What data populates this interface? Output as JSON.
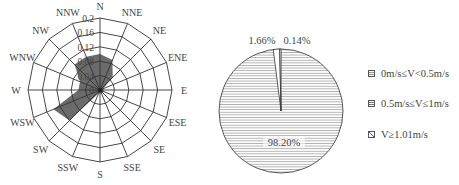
{
  "chart_data": [
    {
      "type": "radar",
      "subtype": "wind-rose",
      "title": "",
      "directions": [
        "N",
        "NNE",
        "NE",
        "ENE",
        "E",
        "ESE",
        "SE",
        "SSE",
        "S",
        "SSW",
        "SW",
        "WSW",
        "W",
        "WNW",
        "NW",
        "NNW"
      ],
      "values": [
        0.1,
        0.09,
        0.05,
        0.01,
        0.01,
        0.01,
        0.01,
        0.01,
        0.01,
        0.01,
        0.12,
        0.14,
        0.06,
        0.06,
        0.1,
        0.1
      ],
      "radial_ticks": [
        "0",
        "0.04",
        "0.08",
        "0.12",
        "0.16",
        "0.2"
      ],
      "radial_range": [
        0,
        0.2
      ],
      "grid": true,
      "fill_color": "#6b6b6b"
    },
    {
      "type": "pie",
      "title": "",
      "categories": [
        "0m/s≤V<0.5m/s",
        "0.5m/s≤V≤1m/s",
        "V≥1.01m/s"
      ],
      "values": [
        0.14,
        1.66,
        98.2
      ],
      "labels": [
        "0.14%",
        "1.66%",
        "98.20%"
      ],
      "legend_position": "right",
      "fill_pattern": "horizontal-lines"
    }
  ],
  "rose": {
    "directions": [
      "N",
      "NNE",
      "NE",
      "ENE",
      "E",
      "ESE",
      "SE",
      "SSE",
      "S",
      "SSW",
      "SW",
      "WSW",
      "W",
      "WNW",
      "NW",
      "NNW"
    ],
    "tick_labels": [
      "0",
      "0.04",
      "0.08",
      "0.12",
      "0.16",
      "0.2"
    ]
  },
  "pie": {
    "label_small_1": "1.66%",
    "label_small_2": "0.14%",
    "label_main": "98.20%"
  },
  "legend": {
    "items": [
      {
        "label": "0m/s≤V<0.5m/s"
      },
      {
        "label": "0.5m/s≤V≤1m/s"
      },
      {
        "label": "V≥1.01m/s"
      }
    ]
  }
}
